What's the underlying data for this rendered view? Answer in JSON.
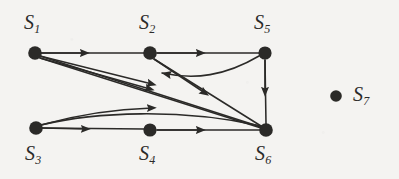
{
  "figure": {
    "type": "directed-graph-diagram",
    "background_color": "#f4f3f1",
    "ink_color": "#2b2a28",
    "node_radius": 6.5,
    "node_radius_small": 5.5,
    "nodes": [
      {
        "id": "S1",
        "label": "S",
        "subscript": "1",
        "cx": 35,
        "cy": 53,
        "label_x": 24,
        "label_y": 12,
        "isolated": false
      },
      {
        "id": "S2",
        "label": "S",
        "subscript": "2",
        "cx": 150,
        "cy": 53,
        "label_x": 139,
        "label_y": 12,
        "isolated": false
      },
      {
        "id": "S5",
        "label": "S",
        "subscript": "5",
        "cx": 265,
        "cy": 53,
        "label_x": 254,
        "label_y": 12,
        "isolated": false
      },
      {
        "id": "S3",
        "label": "S",
        "subscript": "3",
        "cx": 36,
        "cy": 128,
        "label_x": 25,
        "label_y": 143,
        "isolated": false
      },
      {
        "id": "S4",
        "label": "S",
        "subscript": "4",
        "cx": 150,
        "cy": 130,
        "label_x": 139,
        "label_y": 143,
        "isolated": false
      },
      {
        "id": "S6",
        "label": "S",
        "subscript": "6",
        "cx": 266,
        "cy": 130,
        "label_x": 255,
        "label_y": 143,
        "isolated": false
      },
      {
        "id": "S7",
        "label": "S",
        "subscript": "7",
        "cx": 336,
        "cy": 96,
        "label_x": 353,
        "label_y": 84,
        "isolated": true
      }
    ],
    "edges": [
      {
        "from": "S1",
        "to": "S2",
        "shape": "straight",
        "arrow_at": "mid"
      },
      {
        "from": "S1",
        "to": "S6",
        "shape": "straight",
        "arrow_at": "mid"
      },
      {
        "from": "S1",
        "to": "S6",
        "shape": "straight-2",
        "arrow_at": "mid"
      },
      {
        "from": "S2",
        "to": "S5",
        "shape": "straight",
        "arrow_at": "mid"
      },
      {
        "from": "S2",
        "to": "S6",
        "shape": "diagonal",
        "arrow_at": "mid"
      },
      {
        "from": "S5",
        "to": "S6",
        "shape": "vertical",
        "arrow_at": "mid"
      },
      {
        "from": "S5",
        "to": "S2",
        "shape": "curve-left",
        "arrow_at": "end"
      },
      {
        "from": "S3",
        "to": "S4",
        "shape": "straight",
        "arrow_at": "mid"
      },
      {
        "from": "S3",
        "to": "S6",
        "shape": "curve-up",
        "arrow_at": "mid"
      },
      {
        "from": "S4",
        "to": "S6",
        "shape": "straight",
        "arrow_at": "mid"
      }
    ],
    "edge_count": 10,
    "node_count": 7,
    "isolated_nodes": [
      "S7"
    ]
  }
}
